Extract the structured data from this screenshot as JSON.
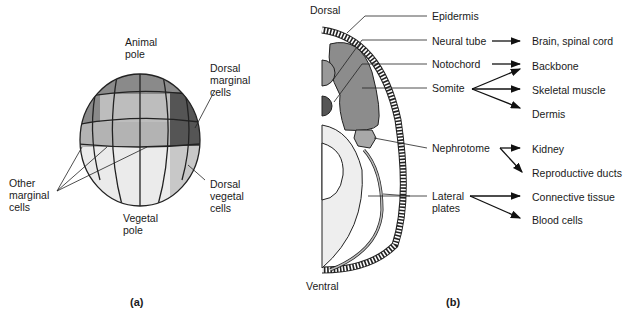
{
  "panel_a": {
    "caption": "(a)",
    "labels": {
      "animal_pole_1": "Animal",
      "animal_pole_2": "pole",
      "dorsal_marginal_1": "Dorsal",
      "dorsal_marginal_2": "marginal",
      "dorsal_marginal_3": "cells",
      "other_marginal_1": "Other",
      "other_marginal_2": "marginal",
      "other_marginal_3": "cells",
      "dorsal_vegetal_1": "Dorsal",
      "dorsal_vegetal_2": "vegetal",
      "dorsal_vegetal_3": "cells",
      "vegetal_pole_1": "Vegetal",
      "vegetal_pole_2": "pole"
    },
    "colors": {
      "animal_tier": "#8a8a8a",
      "marginal_tier": "#b8b8b8",
      "dorsal_marginal": "#555555",
      "vegetal_tier": "#e8e8e8",
      "dorsal_vegetal": "#c8c8c8"
    }
  },
  "panel_b": {
    "caption": "(b)",
    "orientation": {
      "top": "Dorsal",
      "bottom": "Ventral"
    },
    "structures": [
      {
        "name": "Epidermis",
        "fates": []
      },
      {
        "name": "Neural tube",
        "fates": [
          "Brain, spinal cord"
        ]
      },
      {
        "name": "Notochord",
        "fates": [
          "Backbone"
        ]
      },
      {
        "name": "Somite",
        "fates": [
          "Backbone",
          "Skeletal muscle",
          "Dermis"
        ]
      },
      {
        "name": "Nephrotome",
        "fates": [
          "Kidney",
          "Reproductive ducts"
        ]
      },
      {
        "name": "Lateral plates",
        "fates": [
          "Connective tissue",
          "Blood cells"
        ]
      }
    ],
    "labels": {
      "epidermis": "Epidermis",
      "neural_tube": "Neural tube",
      "notochord": "Notochord",
      "somite": "Somite",
      "nephrotome": "Nephrotome",
      "lateral_1": "Lateral",
      "lateral_2": "plates",
      "brain": "Brain, spinal cord",
      "backbone": "Backbone",
      "skeletal": "Skeletal muscle",
      "dermis": "Dermis",
      "kidney": "Kidney",
      "repro": "Reproductive ducts",
      "connective": "Connective tissue",
      "blood": "Blood cells"
    }
  }
}
